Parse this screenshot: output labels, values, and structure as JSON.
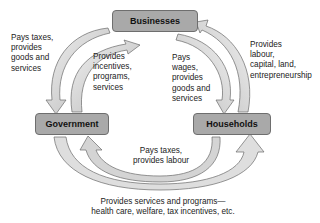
{
  "diagram": {
    "type": "circular flow",
    "nodes": {
      "businesses": "Businesses",
      "government": "Government",
      "households": "Households"
    },
    "flows": {
      "households_to_government_left": "Pays taxes,\nprovides\ngoods and\nservices",
      "government_to_businesses": "Provides\nincentives,\nprograms,\nservices",
      "businesses_to_households": "Pays\nwages,\nprovides\ngoods and\nservices",
      "households_to_businesses": "Provides\nlabour,\ncapital, land,\nentrepreneurship",
      "households_to_government": "Pays taxes,\nprovides labour",
      "government_to_households": "Provides services and programs—\nhealth care, welfare, tax incentives, etc."
    },
    "colors": {
      "box_fill": "#a9a9a9",
      "arrow_light": "#e4e4e4",
      "arrow_mid": "#c8c8c8",
      "arrow_stroke": "#6a6a6a"
    }
  }
}
